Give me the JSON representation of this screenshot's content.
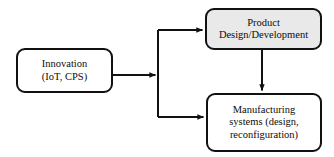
{
  "diagram": {
    "type": "flowchart",
    "title": "",
    "canvas": {
      "width": 334,
      "height": 157,
      "background": "#ffffff"
    },
    "nodes": [
      {
        "id": "innovation",
        "name": "innovation-node",
        "lines": [
          "Innovation",
          "(IoT, CPS)"
        ],
        "text": "Innovation (IoT, CPS)",
        "shape": "rounded-rectangle",
        "fill": "#ffffff",
        "stroke": "#111111"
      },
      {
        "id": "product-design",
        "name": "product-design-development-node",
        "lines": [
          "Product",
          "Design/Development"
        ],
        "text": "Product Design/Development",
        "shape": "rounded-rectangle",
        "fill": "#e9e9e9",
        "stroke": "#111111"
      },
      {
        "id": "manufacturing",
        "name": "manufacturing-systems-node",
        "lines": [
          "Manufacturing",
          "systems (design,",
          "reconfiguration)"
        ],
        "text": "Manufacturing systems (design, reconfiguration)",
        "shape": "rounded-rectangle",
        "fill": "#ffffff",
        "stroke": "#111111"
      }
    ],
    "edges": [
      {
        "id": "innovation-to-junction",
        "name": "edge-innovation-to-branch",
        "from": "innovation",
        "to": "branch-junction",
        "style": "solid",
        "arrowhead": "filled-triangle",
        "label": ""
      },
      {
        "id": "junction-to-product",
        "name": "edge-branch-to-product-design",
        "from": "branch-junction",
        "to": "product-design",
        "style": "solid",
        "arrowhead": "filled-triangle",
        "label": ""
      },
      {
        "id": "junction-to-manufacturing",
        "name": "edge-branch-to-manufacturing",
        "from": "branch-junction",
        "to": "manufacturing",
        "style": "solid",
        "arrowhead": "filled-triangle",
        "label": ""
      },
      {
        "id": "product-to-manufacturing",
        "name": "edge-product-design-to-manufacturing",
        "from": "product-design",
        "to": "manufacturing",
        "style": "solid",
        "arrowhead": "filled-triangle",
        "label": ""
      }
    ]
  }
}
